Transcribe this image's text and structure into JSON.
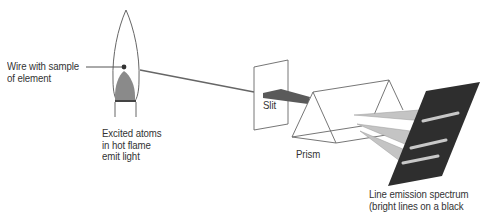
{
  "diagram": {
    "labels": {
      "wire": [
        "Wire with sample",
        "of element"
      ],
      "flame": [
        "Excited atoms",
        "in hot flame",
        "emit light"
      ],
      "slit": "Slit",
      "prism": "Prism",
      "spectrum": [
        "Line emission spectrum",
        "(bright lines on a black"
      ]
    },
    "colors": {
      "outline": "#555555",
      "beam": "#555555",
      "inner_flame": "#8a8a8a",
      "refracted_beams": "#c4c4c4",
      "screen": "#2e2e2e",
      "spectral_lines": "#c8c8c8",
      "text": "#333333"
    }
  }
}
